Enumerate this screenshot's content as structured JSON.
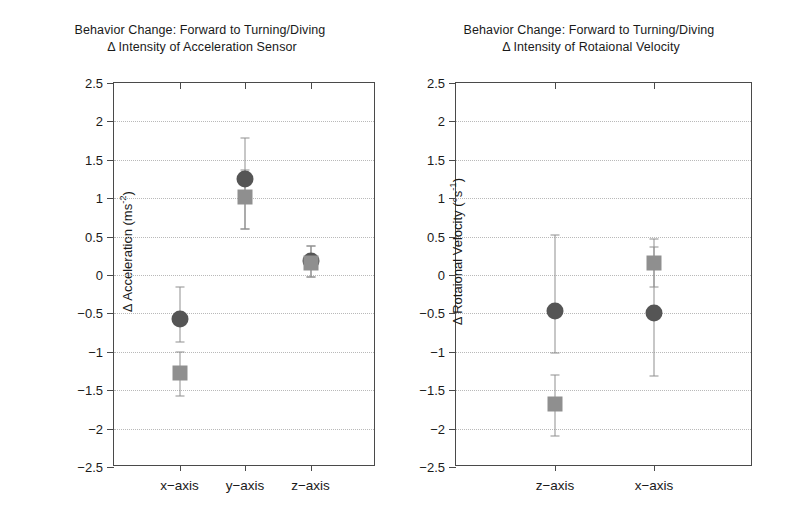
{
  "figure": {
    "background": "#ffffff",
    "axis_color": "#4a4a4a",
    "grid_color": "#b9b9b9"
  },
  "series_styles": {
    "circle_color": "#555555",
    "square_color": "#8f8f8f",
    "errorbar_color": "#8f8f8f"
  },
  "chart_data": [
    {
      "type": "scatter",
      "panel": "left",
      "title": "Behavior Change: Forward to Turning/Diving",
      "subtitle": "Δ Intensity of Acceleration Sensor",
      "xlabel": "",
      "ylabel": "Δ Acceleration (ms⁻²)",
      "ylabel_text": "Δ Acceleration (ms",
      "ylabel_sup": "-2",
      "ylabel_tail": ")",
      "categories": [
        "x-axis",
        "y-axis",
        "z-axis"
      ],
      "ylim": [
        -2.5,
        2.5
      ],
      "ytick_labels": [
        "2.5",
        "2",
        "1.5",
        "1",
        "0.5",
        "0",
        "-0.5",
        "-1",
        "-1.5",
        "-2",
        "-2.5"
      ],
      "ytick_values": [
        2.5,
        2,
        1.5,
        1,
        0.5,
        0,
        -0.5,
        -1,
        -1.5,
        -2,
        -2.5
      ],
      "grid": true,
      "legend_position": "none",
      "series": [
        {
          "name": "circle",
          "marker": "circle",
          "values": [
            -0.57,
            1.25,
            0.18
          ],
          "err_low": [
            -0.87,
            0.6,
            -0.02
          ],
          "err_high": [
            -0.15,
            1.78,
            0.38
          ]
        },
        {
          "name": "square",
          "marker": "square",
          "values": [
            -1.28,
            1.02,
            0.15
          ],
          "err_low": [
            -1.57,
            0.6,
            -0.02
          ],
          "err_high": [
            -1.0,
            1.37,
            0.38
          ]
        }
      ]
    },
    {
      "type": "scatter",
      "panel": "right",
      "title": "Behavior Change: Forward to Turning/Diving",
      "subtitle": "Δ Intensity of Rotaional Velocity",
      "xlabel": "",
      "ylabel": "Δ Rotaional Velocity (°s⁻¹)",
      "ylabel_text": "Δ Rotaional Velocity (°s",
      "ylabel_sup": "-1",
      "ylabel_tail": ")",
      "categories": [
        "z-axis",
        "x-axis"
      ],
      "ylim": [
        -2.5,
        2.5
      ],
      "ytick_labels": [
        "2.5",
        "2",
        "1.5",
        "1",
        "0.5",
        "0",
        "-0.5",
        "-1",
        "-1.5",
        "-2",
        "-2.5"
      ],
      "ytick_values": [
        2.5,
        2,
        1.5,
        1,
        0.5,
        0,
        -0.5,
        -1,
        -1.5,
        -2,
        -2.5
      ],
      "grid": true,
      "legend_position": "none",
      "series": [
        {
          "name": "circle",
          "marker": "circle",
          "values": [
            -0.47,
            -0.5
          ],
          "err_low": [
            -1.02,
            -1.32
          ],
          "err_high": [
            0.52,
            0.36
          ]
        },
        {
          "name": "square",
          "marker": "square",
          "values": [
            -1.68,
            0.15
          ],
          "err_low": [
            -2.1,
            -0.15
          ],
          "err_high": [
            -1.3,
            0.47
          ]
        }
      ]
    }
  ]
}
